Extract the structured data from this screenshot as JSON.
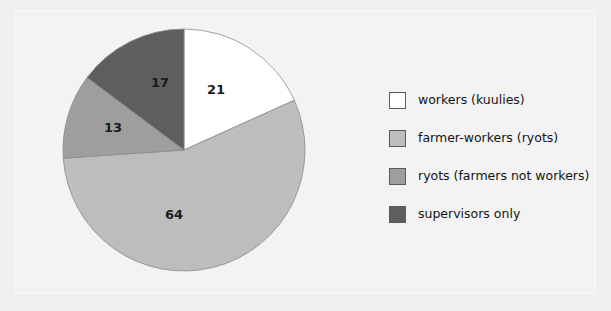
{
  "chart_data": {
    "type": "pie",
    "title": "",
    "subtitle": "",
    "xlabel": "",
    "ylabel": "",
    "grid": false,
    "legend_position": "right",
    "total": 115,
    "start_angle_deg": 0,
    "direction": "clockwise",
    "categories": [
      "workers (kuulies)",
      "farmer-workers (ryots)",
      "ryots (farmers not workers)",
      "supervisors only"
    ],
    "values": [
      21,
      64,
      13,
      17
    ],
    "labels": [
      "21",
      "64",
      "13",
      "17"
    ],
    "colors": [
      "#ffffff",
      "#bdbdbd",
      "#9e9e9e",
      "#5e5e5e"
    ],
    "slices": [
      {
        "label": "workers (kuulies)",
        "value": 21,
        "display": "21",
        "color": "#ffffff",
        "start_angle_deg": 0,
        "sweep_deg": 65.74
      },
      {
        "label": "farmer-workers (ryots)",
        "value": 64,
        "display": "64",
        "color": "#bdbdbd",
        "start_angle_deg": 65.74,
        "sweep_deg": 200.35
      },
      {
        "label": "ryots (farmers not workers)",
        "value": 13,
        "display": "13",
        "color": "#9e9e9e",
        "start_angle_deg": 266.09,
        "sweep_deg": 40.7
      },
      {
        "label": "supervisors only",
        "value": 17,
        "display": "17",
        "color": "#5e5e5e",
        "start_angle_deg": 306.79,
        "sweep_deg": 53.21
      }
    ]
  },
  "pie": {
    "center_x": 184,
    "center_y": 150,
    "radius": 121,
    "label_positions": [
      {
        "x": 216,
        "y": 90
      },
      {
        "x": 174,
        "y": 215
      },
      {
        "x": 113,
        "y": 128
      },
      {
        "x": 160,
        "y": 83
      }
    ]
  },
  "legend": {
    "items": [
      {
        "label": "workers (kuulies)",
        "color": "#ffffff"
      },
      {
        "label": "farmer-workers (ryots)",
        "color": "#bdbdbd"
      },
      {
        "label": "ryots (farmers not workers)",
        "color": "#9e9e9e"
      },
      {
        "label": "supervisors only",
        "color": "#5e5e5e"
      }
    ]
  },
  "theme": {
    "background": "#efefef",
    "panel": "#f3f3f3",
    "text": "#141414",
    "slice_outline": "#8a8a8a"
  }
}
